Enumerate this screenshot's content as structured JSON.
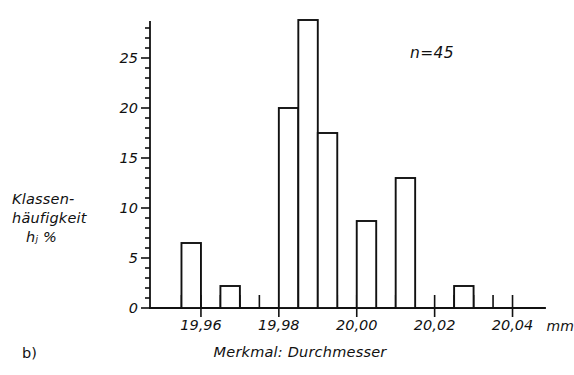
{
  "figure": {
    "tag": "b)",
    "annotation": "n=45",
    "y_axis_title_lines": [
      "Klassen-",
      "häufigkeit",
      "hⱼ  %"
    ],
    "x_axis_title": "Merkmal: Durchmesser",
    "x_unit": "mm",
    "ink_color": "#111111",
    "background_color": "#ffffff"
  },
  "chart_data": {
    "type": "bar",
    "title": "",
    "subtitle": "",
    "xlabel": "Merkmal: Durchmesser",
    "ylabel": "Klassenhäufigkeit hⱼ %",
    "annotations": [
      "n=45"
    ],
    "grid": false,
    "legend": "none",
    "xlim": [
      19.95,
      20.045
    ],
    "ylim": [
      0,
      29.5
    ],
    "yticks": [
      0,
      5,
      10,
      15,
      20,
      25
    ],
    "ytick_labels": [
      "0",
      "5",
      "10",
      "15",
      "20",
      "25"
    ],
    "y_minor_tick_step": 1,
    "xticks": [
      19.96,
      19.98,
      20.0,
      20.02,
      20.04
    ],
    "xtick_labels": [
      "19,96",
      "19,98",
      "20,00",
      "20,02",
      "20,04"
    ],
    "x_minor_tick_step": 0.005,
    "x_unit": "mm",
    "bar_width": 0.005,
    "categories": [
      "19,9575",
      "19,9675",
      "19,9825",
      "19,9875",
      "19,9925",
      "20,0025",
      "20,0125",
      "20,0275"
    ],
    "x": [
      19.9575,
      19.9675,
      19.9825,
      19.9875,
      19.9925,
      20.0025,
      20.0125,
      20.0275
    ],
    "values": [
      6.5,
      2.2,
      20.0,
      28.8,
      17.5,
      8.7,
      13.0,
      2.2
    ]
  }
}
